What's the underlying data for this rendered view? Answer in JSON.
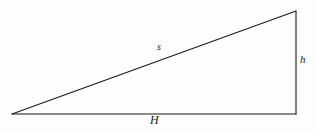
{
  "figure": {
    "name": "right-triangle-diagram",
    "background_color": "#fdfdfd",
    "stroke_color": "#1a1a1a",
    "stroke_width": 1.1
  },
  "geometry": {
    "vertices": {
      "left": {
        "x": 12,
        "y": 114
      },
      "top_right": {
        "x": 296,
        "y": 11
      },
      "bottom_right": {
        "x": 296,
        "y": 114
      }
    },
    "edges": [
      {
        "name": "hypotenuse",
        "from": "left",
        "to": "top_right",
        "label": "s"
      },
      {
        "name": "vertical-leg",
        "from": "top_right",
        "to": "bottom_right",
        "label": "h"
      },
      {
        "name": "horizontal-leg",
        "from": "bottom_right",
        "to": "left",
        "label": "H"
      }
    ]
  },
  "labels": {
    "hypotenuse": "s",
    "vertical": "h",
    "horizontal": "H"
  }
}
